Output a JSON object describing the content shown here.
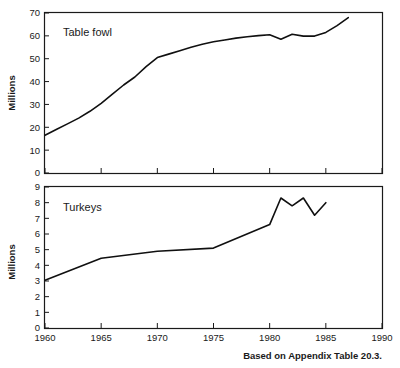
{
  "figure": {
    "caption": "Based on Appendix Table 20.3.",
    "shared_xlabel": "",
    "panels": [
      {
        "label": "Table fowl"
      },
      {
        "label": "Turkeys"
      }
    ]
  },
  "chart_data": [
    {
      "type": "line",
      "title": "Table fowl",
      "xlabel": "",
      "ylabel": "Millions",
      "xlim": [
        1960,
        1990
      ],
      "ylim": [
        0,
        70
      ],
      "xticks": [
        1960,
        1965,
        1970,
        1975,
        1980,
        1985,
        1990
      ],
      "xticklabels": [
        "",
        "",
        "",
        "",
        "",
        "",
        ""
      ],
      "yticks": [
        0,
        10,
        20,
        30,
        40,
        50,
        60,
        70
      ],
      "yticklabels": [
        "0",
        "10",
        "20",
        "30",
        "40",
        "50",
        "60",
        "70"
      ],
      "grid": false,
      "legend": "none",
      "annotations": [
        "Table fowl"
      ],
      "x": [
        1960,
        1961,
        1962,
        1963,
        1964,
        1965,
        1966,
        1967,
        1968,
        1969,
        1970,
        1971,
        1972,
        1973,
        1974,
        1975,
        1976,
        1977,
        1978,
        1979,
        1980,
        1981,
        1982,
        1983,
        1984,
        1985,
        1986,
        1987
      ],
      "values": [
        16.5,
        19.0,
        21.5,
        24.0,
        27.0,
        30.5,
        34.5,
        38.5,
        42.0,
        46.5,
        50.5,
        52.0,
        53.5,
        55.0,
        56.3,
        57.4,
        58.2,
        59.0,
        59.6,
        60.1,
        60.5,
        58.5,
        60.7,
        59.9,
        59.9,
        61.5,
        64.5,
        68.0
      ]
    },
    {
      "type": "line",
      "title": "Turkeys",
      "xlabel": "",
      "ylabel": "Millions",
      "xlim": [
        1960,
        1990
      ],
      "ylim": [
        0,
        9
      ],
      "xticks": [
        1960,
        1965,
        1970,
        1975,
        1980,
        1985,
        1990
      ],
      "xticklabels": [
        "1960",
        "1965",
        "1970",
        "1975",
        "1980",
        "1985",
        "1990"
      ],
      "yticks": [
        0,
        1,
        2,
        3,
        4,
        5,
        6,
        7,
        8,
        9
      ],
      "yticklabels": [
        "0",
        "1",
        "2",
        "3",
        "4",
        "5",
        "6",
        "7",
        "8",
        "9"
      ],
      "grid": false,
      "legend": "none",
      "annotations": [
        "Turkeys"
      ],
      "x": [
        1960,
        1965,
        1970,
        1975,
        1980,
        1981,
        1982,
        1983,
        1984,
        1985
      ],
      "values": [
        3.05,
        4.45,
        4.9,
        5.1,
        6.6,
        8.3,
        7.8,
        8.3,
        7.2,
        8.0
      ]
    }
  ],
  "colors": {
    "line": "#101010",
    "axis": "#1a1a1a",
    "background": "#ffffff"
  }
}
